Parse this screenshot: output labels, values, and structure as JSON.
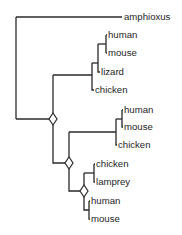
{
  "diagram": {
    "type": "phylogenetic-tree",
    "colors": {
      "line": "#2a2a2a",
      "text": "#1e1e1e",
      "background": "#ffffff"
    },
    "leaves": [
      {
        "id": "amphioxus",
        "label": "amphioxus",
        "x": 124,
        "y": 17
      },
      {
        "id": "human1",
        "label": "human",
        "x": 108,
        "y": 35
      },
      {
        "id": "mouse1",
        "label": "mouse",
        "x": 108,
        "y": 53
      },
      {
        "id": "lizard",
        "label": "lizard",
        "x": 101,
        "y": 72
      },
      {
        "id": "chicken1",
        "label": "chicken",
        "x": 95,
        "y": 90
      },
      {
        "id": "human2",
        "label": "human",
        "x": 124,
        "y": 110
      },
      {
        "id": "mouse2",
        "label": "mouse",
        "x": 124,
        "y": 127
      },
      {
        "id": "chicken2",
        "label": "chicken",
        "x": 118,
        "y": 145
      },
      {
        "id": "chicken3",
        "label": "chicken",
        "x": 96,
        "y": 164
      },
      {
        "id": "lamprey",
        "label": "lamprey",
        "x": 96,
        "y": 182
      },
      {
        "id": "human3",
        "label": "human",
        "x": 91,
        "y": 201
      },
      {
        "id": "mouse3",
        "label": "mouse",
        "x": 91,
        "y": 219
      }
    ],
    "duplication_nodes": [
      {
        "id": "dup1",
        "x": 53,
        "y": 119
      },
      {
        "id": "dup2",
        "x": 69,
        "y": 163
      },
      {
        "id": "dup3",
        "x": 84,
        "y": 191
      }
    ],
    "legend": {
      "diamond": "gene duplication node"
    }
  }
}
